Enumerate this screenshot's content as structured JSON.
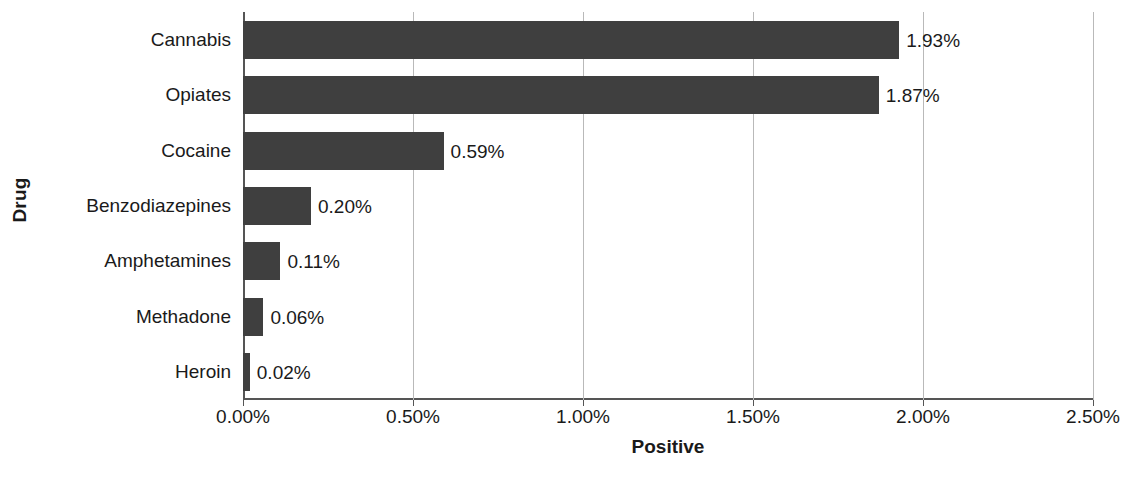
{
  "chart_data": {
    "type": "bar",
    "orientation": "horizontal",
    "title": "",
    "xlabel": "Positive",
    "ylabel": "Drug",
    "categories": [
      "Cannabis",
      "Opiates",
      "Cocaine",
      "Benzodiazepines",
      "Amphetamines",
      "Methadone",
      "Heroin"
    ],
    "values": [
      1.93,
      1.87,
      0.59,
      0.2,
      0.11,
      0.06,
      0.02
    ],
    "value_labels": [
      "1.93%",
      "1.87%",
      "0.59%",
      "0.20%",
      "0.11%",
      "0.06%",
      "0.02%"
    ],
    "xlim": [
      0.0,
      2.5
    ],
    "x_ticks": [
      0.0,
      0.5,
      1.0,
      1.5,
      2.0,
      2.5
    ],
    "x_tick_labels": [
      "0.00%",
      "0.50%",
      "1.00%",
      "1.50%",
      "2.00%",
      "2.50%"
    ],
    "grid": "vertical",
    "legend": "none",
    "bar_color": "#3f3f3f",
    "axis_color": "#555555",
    "gridline_color": "#b9b9b9",
    "background_color": "#ffffff"
  }
}
